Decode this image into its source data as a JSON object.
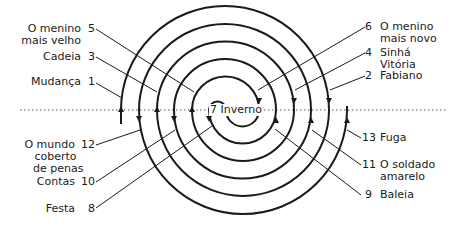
{
  "diagram": {
    "type": "double-spiral chapter diagram",
    "center": {
      "number": "7",
      "title": "Inverno"
    },
    "left_labels": [
      {
        "number": "5",
        "title_lines": [
          "O menino",
          "mais velho"
        ]
      },
      {
        "number": "3",
        "title_lines": [
          "Cadeia"
        ]
      },
      {
        "number": "1",
        "title_lines": [
          "Mudança"
        ]
      },
      {
        "number": "12",
        "title_lines": [
          "O mundo",
          "coberto",
          "de penas"
        ]
      },
      {
        "number": "10",
        "title_lines": [
          "Contas"
        ]
      },
      {
        "number": "8",
        "title_lines": [
          "Festa"
        ]
      }
    ],
    "right_labels": [
      {
        "number": "6",
        "title_lines": [
          "O menino",
          "mais novo"
        ]
      },
      {
        "number": "4",
        "title_lines": [
          "Sinhá",
          "Vitória"
        ]
      },
      {
        "number": "2",
        "title_lines": [
          "Fabiano"
        ]
      },
      {
        "number": "13",
        "title_lines": [
          "Fuga"
        ]
      },
      {
        "number": "11",
        "title_lines": [
          "O soldado",
          "amarelo"
        ]
      },
      {
        "number": "9",
        "title_lines": [
          "Baleia"
        ]
      }
    ],
    "colors": {
      "line": "#1a1a1a",
      "dotted_axis": "#555555"
    }
  }
}
